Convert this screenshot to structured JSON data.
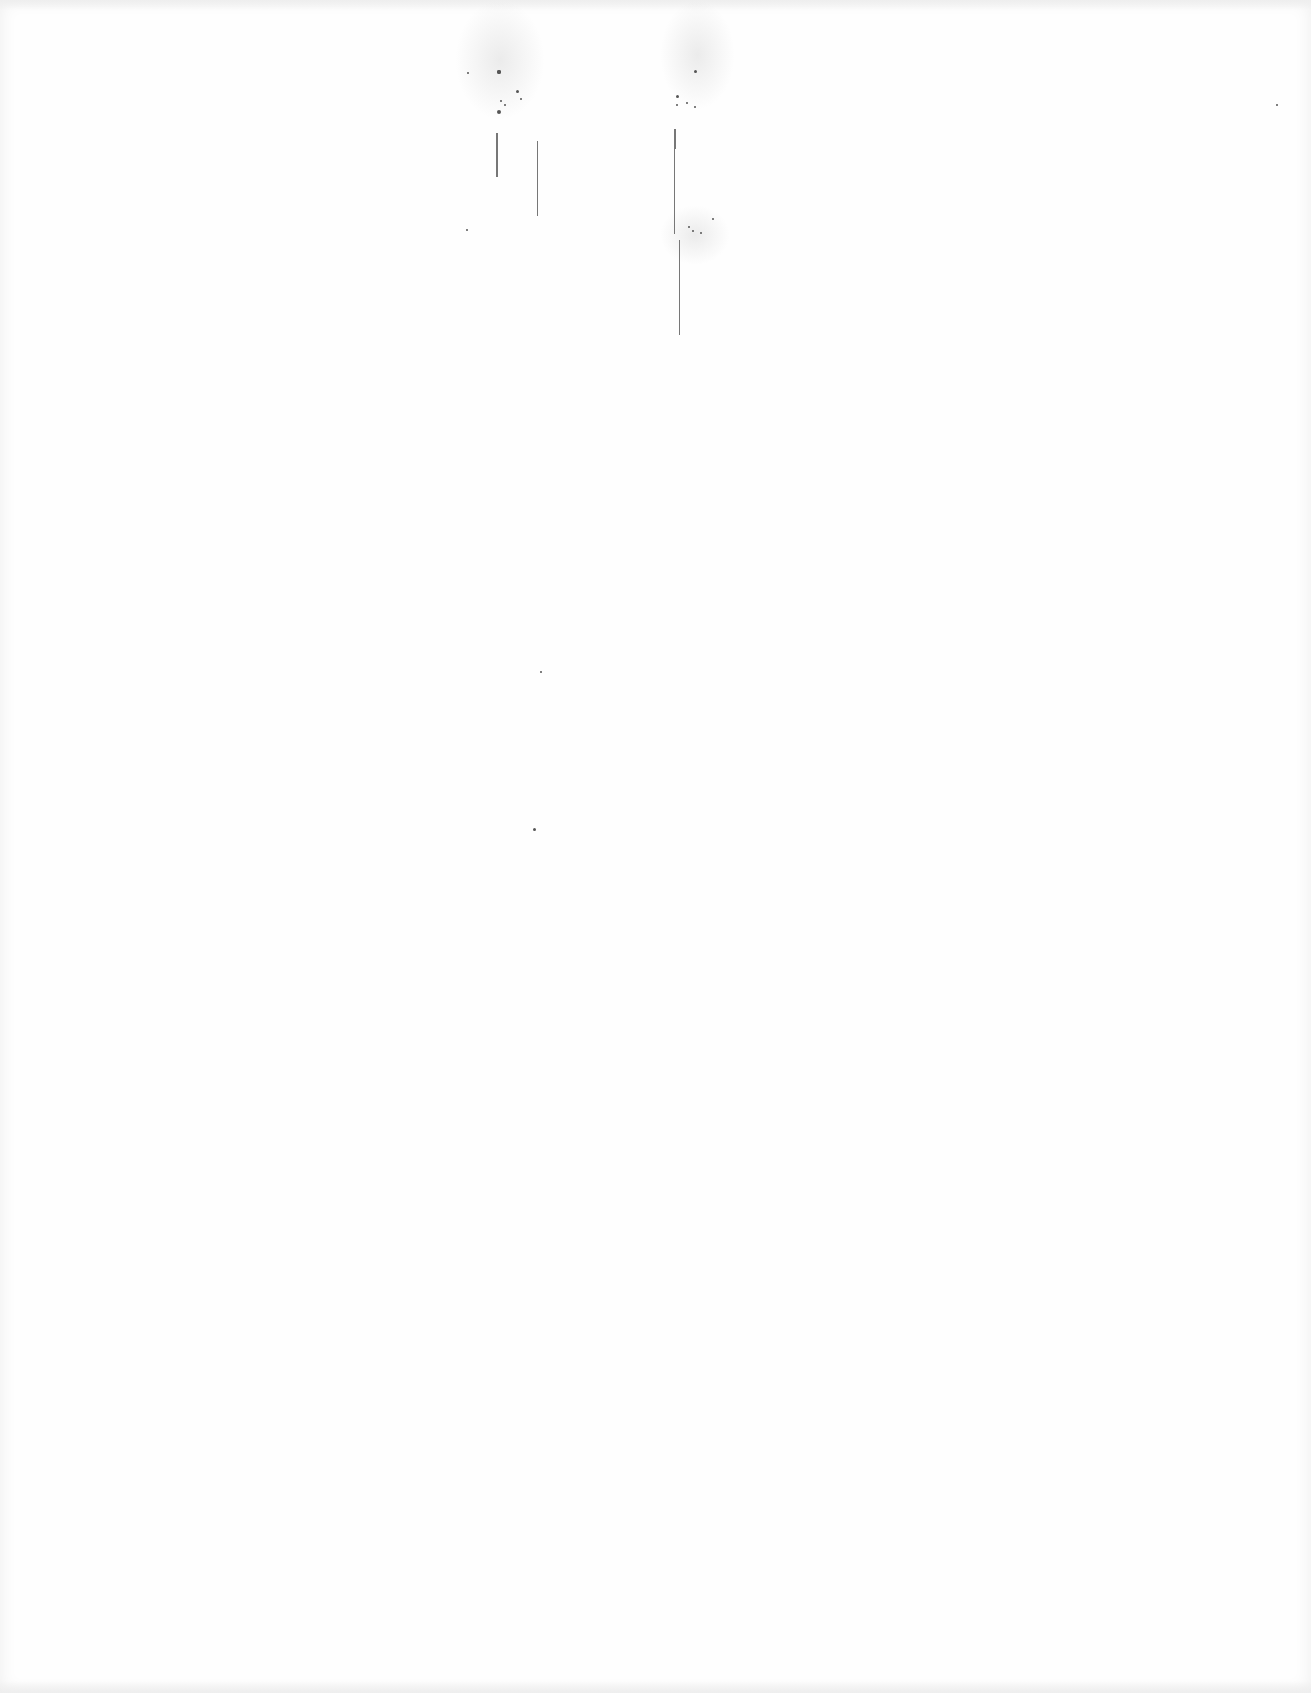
{
  "page": {
    "type": "blank-scanned-page",
    "text_content": "",
    "artifacts": {
      "specks": [
        {
          "x": 497,
          "y": 70,
          "s": 4
        },
        {
          "x": 497,
          "y": 70,
          "s": 4
        },
        {
          "x": 516,
          "y": 90,
          "s": 3
        },
        {
          "x": 497,
          "y": 110,
          "s": 4
        },
        {
          "x": 500,
          "y": 100,
          "s": 2
        },
        {
          "x": 520,
          "y": 98,
          "s": 2
        },
        {
          "x": 467,
          "y": 72,
          "s": 2
        },
        {
          "x": 504,
          "y": 104,
          "s": 2
        },
        {
          "x": 466,
          "y": 229,
          "s": 2
        },
        {
          "x": 676,
          "y": 95,
          "s": 3
        },
        {
          "x": 694,
          "y": 70,
          "s": 3
        },
        {
          "x": 686,
          "y": 102,
          "s": 2
        },
        {
          "x": 694,
          "y": 106,
          "s": 2
        },
        {
          "x": 676,
          "y": 104,
          "s": 2
        },
        {
          "x": 692,
          "y": 230,
          "s": 2
        },
        {
          "x": 712,
          "y": 218,
          "s": 2
        },
        {
          "x": 688,
          "y": 226,
          "s": 2
        },
        {
          "x": 700,
          "y": 232,
          "s": 2
        },
        {
          "x": 540,
          "y": 671,
          "s": 2
        },
        {
          "x": 533,
          "y": 828,
          "s": 3
        },
        {
          "x": 1276,
          "y": 104,
          "s": 2
        }
      ],
      "streaks": [
        {
          "x": 496,
          "y": 133,
          "w": 2,
          "h": 44
        },
        {
          "x": 537,
          "y": 141,
          "w": 1,
          "h": 75
        },
        {
          "x": 674,
          "y": 129,
          "w": 2,
          "h": 20
        },
        {
          "x": 674,
          "y": 149,
          "w": 1,
          "h": 85
        },
        {
          "x": 679,
          "y": 240,
          "w": 1,
          "h": 95
        }
      ],
      "haze": [
        {
          "x": 455,
          "y": 0,
          "w": 90,
          "h": 120
        },
        {
          "x": 660,
          "y": 0,
          "w": 75,
          "h": 110
        },
        {
          "x": 660,
          "y": 205,
          "w": 70,
          "h": 60
        }
      ]
    }
  }
}
